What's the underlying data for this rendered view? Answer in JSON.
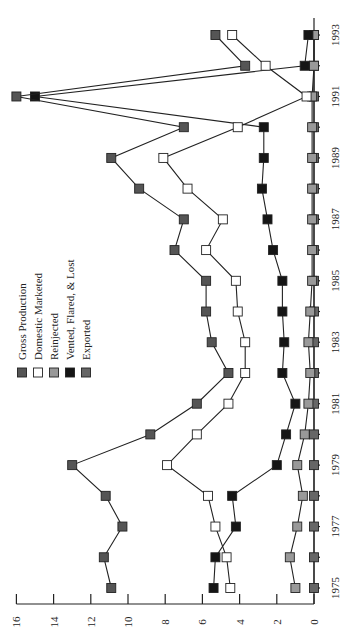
{
  "chart_data": {
    "type": "line",
    "orientation": "rotated-90-ccw",
    "title": "",
    "xlabel": "",
    "ylabel": "",
    "x": [
      1975,
      1976,
      1977,
      1978,
      1979,
      1980,
      1981,
      1982,
      1983,
      1984,
      1985,
      1986,
      1987,
      1988,
      1989,
      1990,
      1991,
      1992,
      1993
    ],
    "x_tick_labels": [
      "1975",
      "1977",
      "1979",
      "1981",
      "1983",
      "1985",
      "1987",
      "1989",
      "1991",
      "1993"
    ],
    "ylim": [
      0,
      16
    ],
    "y_tick_labels": [
      "0",
      "2",
      "4",
      "6",
      "8",
      "10",
      "12",
      "14",
      "16"
    ],
    "grid": false,
    "legend_position": "upper-left (rotated)",
    "series": [
      {
        "name": "Gross Production",
        "color": "#555555",
        "values": [
          10.9,
          11.3,
          10.3,
          11.2,
          13.0,
          8.8,
          6.3,
          4.6,
          5.5,
          5.8,
          5.8,
          7.5,
          7.0,
          9.4,
          10.9,
          7.0,
          16.0,
          3.7,
          5.3
        ]
      },
      {
        "name": "Domestic Marketed",
        "color": "#ffffff",
        "values": [
          4.5,
          4.7,
          5.3,
          5.7,
          7.9,
          6.3,
          4.6,
          3.7,
          3.7,
          4.1,
          4.2,
          5.8,
          4.9,
          6.8,
          8.1,
          4.1,
          0.4,
          2.6,
          4.4
        ]
      },
      {
        "name": "Reinjected",
        "color": "#999999",
        "values": [
          1.0,
          1.3,
          0.9,
          0.6,
          0.9,
          0.5,
          0.3,
          0.2,
          0.3,
          0.2,
          0.1,
          0.1,
          0.1,
          0.1,
          0.1,
          0.1,
          0.1,
          0.0,
          0.0
        ]
      },
      {
        "name": "Vented, Flared, & Lost",
        "color": "#151515",
        "values": [
          5.4,
          5.3,
          4.2,
          4.4,
          2.0,
          1.5,
          1.0,
          1.7,
          1.6,
          1.7,
          1.7,
          2.2,
          2.5,
          2.8,
          2.7,
          2.7,
          15.0,
          0.5,
          0.3
        ]
      },
      {
        "name": "Exported",
        "color": "#666666",
        "values": [
          0,
          0,
          0,
          0,
          0,
          0,
          0,
          0,
          0,
          0,
          0,
          0,
          0,
          0,
          0,
          0,
          0,
          0,
          0
        ]
      }
    ]
  },
  "legend": {
    "items": [
      {
        "label": "Gross Production",
        "color": "#555555"
      },
      {
        "label": "Domestic Marketed",
        "color": "#ffffff"
      },
      {
        "label": "Reinjected",
        "color": "#999999"
      },
      {
        "label": "Vented, Flared, & Lost",
        "color": "#151515"
      },
      {
        "label": "Exported",
        "color": "#666666"
      }
    ]
  }
}
